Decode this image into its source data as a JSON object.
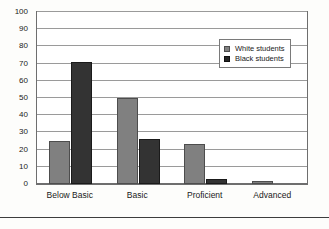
{
  "chart_data": {
    "type": "bar",
    "title": "",
    "subtitle": "",
    "xlabel": "",
    "ylabel": "",
    "categories": [
      "Below Basic",
      "Basic",
      "Proficient",
      "Advanced"
    ],
    "series": [
      {
        "name": "White students",
        "color": "#808080",
        "values": [
          25,
          50,
          23,
          2
        ]
      },
      {
        "name": "Black students",
        "color": "#333333",
        "values": [
          71,
          26,
          3,
          0
        ]
      }
    ],
    "ylim": [
      0,
      100
    ],
    "ytick_step": 10,
    "yticks": [
      "100",
      "90",
      "80",
      "70",
      "60",
      "50",
      "40",
      "30",
      "20",
      "10",
      "0"
    ],
    "grid": true,
    "grid_axis": "y",
    "legend_position": "top-right",
    "legend": [
      {
        "label": "White students",
        "swatch": "white-students-swatch"
      },
      {
        "label": "Black students",
        "swatch": "black-students-swatch"
      }
    ]
  }
}
